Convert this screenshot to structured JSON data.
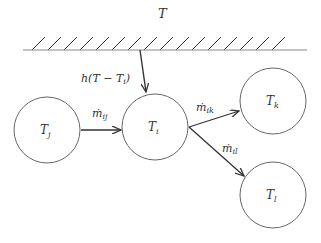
{
  "diagram": {
    "type": "heat-mass-flow-network",
    "ambient_label": "T",
    "wall": {
      "x1": 23,
      "x2": 307,
      "y": 50,
      "hatch_x_start": 32,
      "hatch_x_end": 285,
      "hatch_step": 16
    },
    "heat_flux": {
      "label": "h(T − T",
      "label_sub": "i",
      "label_end": ")",
      "from": [
        140,
        50
      ],
      "to": [
        146,
        92
      ]
    },
    "nodes": [
      {
        "id": "j",
        "label": "T",
        "sub": "j",
        "cx": 47,
        "cy": 130,
        "r": 33
      },
      {
        "id": "i",
        "label": "T",
        "sub": "i",
        "cx": 155,
        "cy": 127,
        "r": 33
      },
      {
        "id": "k",
        "label": "T",
        "sub": "k",
        "cx": 273,
        "cy": 101,
        "r": 33
      },
      {
        "id": "l",
        "label": "T",
        "sub": "l",
        "cx": 273,
        "cy": 195,
        "r": 33
      }
    ],
    "edges": [
      {
        "id": "ij",
        "label": "ṁ",
        "sub": "ij",
        "from": [
          81,
          130
        ],
        "to": [
          121,
          130
        ],
        "lx": 92,
        "ly": 117
      },
      {
        "id": "ik",
        "label": "ṁ",
        "sub": "ik",
        "from": [
          189,
          127
        ],
        "to": [
          239,
          111
        ],
        "lx": 196,
        "ly": 111
      },
      {
        "id": "il",
        "label": "ṁ",
        "sub": "il",
        "from": [
          189,
          127
        ],
        "to": [
          244,
          176
        ],
        "lx": 222,
        "ly": 152
      }
    ],
    "colors": {
      "stroke": "#333333",
      "circle": "#555555",
      "wall": "#888888",
      "text": "#333333"
    }
  }
}
